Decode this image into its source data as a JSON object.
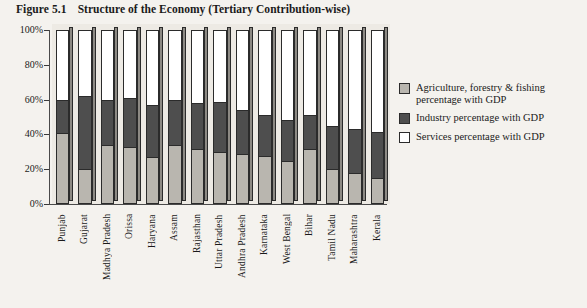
{
  "figure": {
    "label": "Figure 5.1",
    "title": "Structure of the Economy (Tertiary Contribution-wise)"
  },
  "legend": {
    "position": "right",
    "items": [
      {
        "name": "agriculture",
        "label": "Agriculture, forestry & fishing percentage with GDP",
        "color": "#b9b6af"
      },
      {
        "name": "industry",
        "label": "Industry percentage with GDP",
        "color": "#4e4e4e"
      },
      {
        "name": "services",
        "label": "Services percentage with GDP",
        "color": "#ffffff"
      }
    ]
  },
  "axis": {
    "y_ticks": [
      "0%",
      "20%",
      "40%",
      "60%",
      "80%",
      "100%"
    ]
  },
  "chart_data": {
    "type": "bar",
    "stacked": true,
    "orientation": "vertical",
    "title": "Structure of the Economy (Tertiary Contribution-wise)",
    "xlabel": "",
    "ylabel": "",
    "ylim": [
      0,
      100
    ],
    "ytick_labels": [
      "0%",
      "20%",
      "40%",
      "60%",
      "80%",
      "100%"
    ],
    "ytick_values": [
      0,
      20,
      40,
      60,
      80,
      100
    ],
    "grid": false,
    "legend_position": "right",
    "categories": [
      "Punjab",
      "Gujarat",
      "Madhya Pradesh",
      "Orissa",
      "Haryana",
      "Assam",
      "Rajasthan",
      "Uttar Pradesh",
      "Andhra Pradesh",
      "Karnataka",
      "West Bengal",
      "Bihar",
      "Tamil Nadu",
      "Maharashtra",
      "Kerala"
    ],
    "series": [
      {
        "name": "Agriculture, forestry & fishing percentage with GDP",
        "color": "#b9b6af",
        "values": [
          40,
          19,
          33,
          32,
          26,
          33,
          31,
          29,
          28,
          27,
          24,
          31,
          19,
          17,
          14
        ]
      },
      {
        "name": "Industry percentage with GDP",
        "color": "#4e4e4e",
        "values": [
          20,
          43,
          27,
          29,
          31,
          27,
          27,
          30,
          26,
          24,
          24,
          20,
          26,
          26,
          27
        ]
      },
      {
        "name": "Services percentage with GDP",
        "color": "#ffffff",
        "values": [
          40,
          38,
          40,
          39,
          43,
          40,
          42,
          41,
          46,
          49,
          52,
          49,
          55,
          57,
          59
        ]
      }
    ]
  }
}
